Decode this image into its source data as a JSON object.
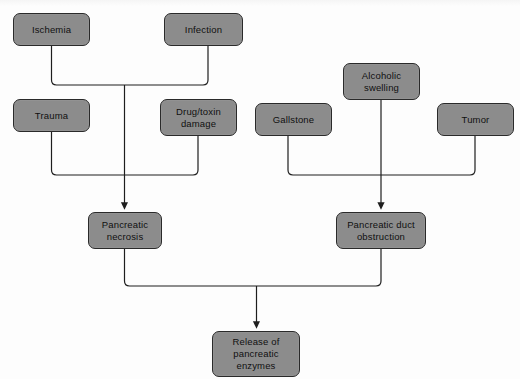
{
  "diagram": {
    "colors": {
      "node_fill": "#8c8c8c",
      "node_border": "#2a2a2a",
      "connector": "#1e1e1e",
      "background": "#fdfdfd"
    },
    "nodes": [
      {
        "id": "ischemia",
        "label": "Ischemia",
        "x": 13,
        "y": 13,
        "w": 77,
        "h": 33
      },
      {
        "id": "infection",
        "label": "Infection",
        "x": 164,
        "y": 13,
        "w": 79,
        "h": 33
      },
      {
        "id": "trauma",
        "label": "Trauma",
        "x": 13,
        "y": 99,
        "w": 77,
        "h": 33
      },
      {
        "id": "drugtoxin",
        "label": "Drug/toxin\ndamage",
        "x": 160,
        "y": 99,
        "w": 77,
        "h": 37
      },
      {
        "id": "gallstone",
        "label": "Gallstone",
        "x": 255,
        "y": 103,
        "w": 77,
        "h": 33
      },
      {
        "id": "alcoholic",
        "label": "Alcoholic\nswelling",
        "x": 343,
        "y": 63,
        "w": 77,
        "h": 37
      },
      {
        "id": "tumor",
        "label": "Tumor",
        "x": 437,
        "y": 103,
        "w": 77,
        "h": 33
      },
      {
        "id": "necrosis",
        "label": "Pancreatic\nnecrosis",
        "x": 88,
        "y": 212,
        "w": 74,
        "h": 37
      },
      {
        "id": "obstruction",
        "label": "Pancreatic duct\nobstruction",
        "x": 336,
        "y": 212,
        "w": 90,
        "h": 37
      },
      {
        "id": "release",
        "label": "Release of\npancreatic\nenzymes",
        "x": 212,
        "y": 331,
        "w": 88,
        "h": 46
      }
    ],
    "edges": [
      {
        "from": "ischemia",
        "to": "necrosis"
      },
      {
        "from": "infection",
        "to": "necrosis"
      },
      {
        "from": "trauma",
        "to": "necrosis"
      },
      {
        "from": "drugtoxin",
        "to": "necrosis"
      },
      {
        "from": "gallstone",
        "to": "obstruction"
      },
      {
        "from": "alcoholic",
        "to": "obstruction"
      },
      {
        "from": "tumor",
        "to": "obstruction"
      },
      {
        "from": "necrosis",
        "to": "release"
      },
      {
        "from": "obstruction",
        "to": "release"
      }
    ]
  }
}
